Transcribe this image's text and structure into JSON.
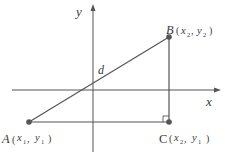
{
  "diagram": {
    "type": "distance-between-two-points",
    "axes": {
      "x_label": "x",
      "y_label": "y"
    },
    "segment_label": "d",
    "points": {
      "A": {
        "name": "A",
        "coords_x": "x",
        "coords_x_sub": "1",
        "coords_y": "y",
        "coords_y_sub": "1"
      },
      "B": {
        "name": "B",
        "coords_x": "x",
        "coords_x_sub": "2",
        "coords_y": "y",
        "coords_y_sub": "2"
      },
      "C": {
        "name": "C",
        "coords_x": "x",
        "coords_x_sub": "2",
        "coords_y": "y",
        "coords_y_sub": "1"
      }
    },
    "colors": {
      "stroke": "#555555",
      "point": "#555555",
      "text": "#3a3a3a"
    }
  }
}
